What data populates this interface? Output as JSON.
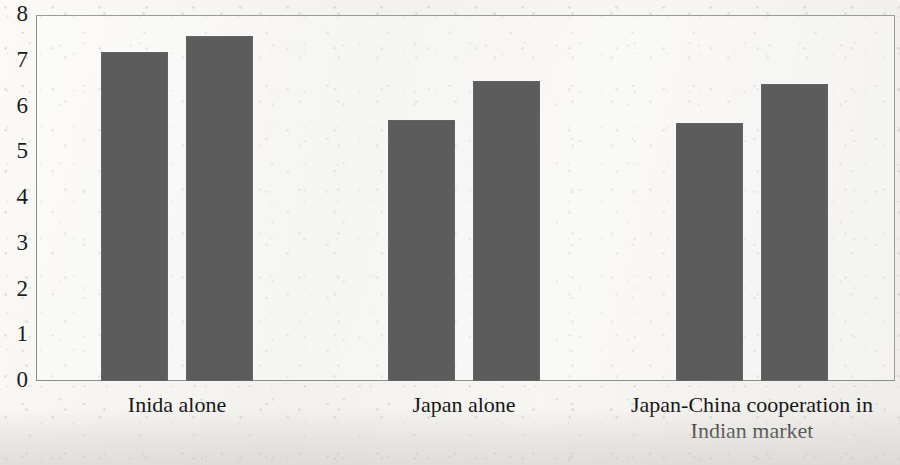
{
  "chart_data": {
    "type": "bar",
    "title": "",
    "subtitle": "",
    "xlabel": "",
    "ylabel": "",
    "categories": [
      "Inida alone",
      "Japan alone",
      "Japan-China cooperation in\nIndian market"
    ],
    "series": [
      {
        "name": "Series 1",
        "values": [
          7.2,
          5.7,
          5.65
        ]
      },
      {
        "name": "Series 2",
        "values": [
          7.55,
          6.55,
          6.5
        ]
      }
    ],
    "ylim": [
      0,
      8
    ],
    "ytick_labels": [
      "8",
      "7",
      "6",
      "5",
      "4",
      "3",
      "2",
      "1",
      "0"
    ],
    "ytick_values": [
      8,
      7,
      6,
      5,
      4,
      3,
      2,
      1,
      0
    ],
    "grid": false,
    "legend": false,
    "legend_position": "none",
    "annotations": [],
    "bar_color": "#5c5c5c",
    "axis_color": "#8d8d8d",
    "background_color": "#f5f4f1",
    "text_color": "#151515"
  }
}
